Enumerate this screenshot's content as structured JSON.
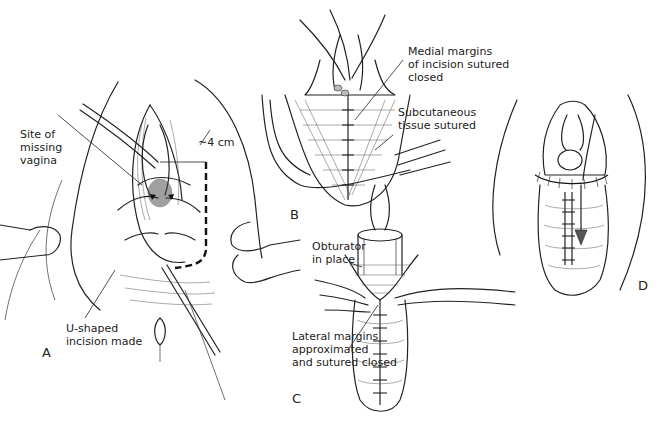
{
  "figure": {
    "panels": [
      {
        "id": "A",
        "letter": "A",
        "labels": [
          {
            "key": "site",
            "text": "Site of\nmissing\nvagina"
          },
          {
            "key": "measure",
            "text": "~4 cm"
          },
          {
            "key": "incision",
            "text": "U-shaped\nincision made"
          }
        ]
      },
      {
        "id": "B",
        "letter": "B",
        "labels": [
          {
            "key": "medial",
            "text": "Medial margins\nof incision sutured\nclosed"
          },
          {
            "key": "subcut",
            "text": "Subcutaneous\ntissue sutured"
          }
        ]
      },
      {
        "id": "C",
        "letter": "C",
        "labels": [
          {
            "key": "obturator",
            "text": "Obturator\nin place"
          },
          {
            "key": "lateral",
            "text": "Lateral margins\napproximated\nand sutured closed"
          }
        ]
      },
      {
        "id": "D",
        "letter": "D",
        "labels": []
      }
    ]
  }
}
